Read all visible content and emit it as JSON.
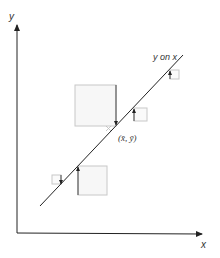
{
  "diagram": {
    "axes": {
      "x_label": "x",
      "y_label": "y"
    },
    "line_label": "y on x",
    "mean_point_label": "(x̄, ȳ)",
    "residual_squares_count": 5,
    "colors": {
      "axis": "#222222",
      "line": "#222222",
      "square_stroke": "#c8c8c8",
      "square_fill": "#f7f7f7",
      "residual": "#333333"
    }
  }
}
